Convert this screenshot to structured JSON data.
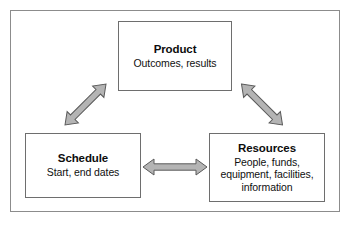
{
  "diagram": {
    "frame": {
      "name": "outer-frame"
    },
    "nodes": [
      {
        "id": "product",
        "title": "Product",
        "description_lines": [
          "Outcomes, results"
        ]
      },
      {
        "id": "schedule",
        "title": "Schedule",
        "description_lines": [
          "Start, end dates"
        ]
      },
      {
        "id": "resources",
        "title": "Resources",
        "description_lines": [
          "People, funds,",
          "equipment, facilities,",
          "information"
        ]
      }
    ],
    "connectors": [
      {
        "id": "schedule-product",
        "from": "Schedule",
        "to": "Product",
        "style": "double-headed-arrow",
        "direction": "diagonal-up-right"
      },
      {
        "id": "product-resources",
        "from": "Product",
        "to": "Resources",
        "style": "double-headed-arrow",
        "direction": "diagonal-down-right"
      },
      {
        "id": "schedule-resources",
        "from": "Schedule",
        "to": "Resources",
        "style": "double-headed-arrow",
        "direction": "horizontal"
      }
    ],
    "colors": {
      "arrow_fill": "#b4b4b4",
      "arrow_outline": "#5a5a5a",
      "box_border": "#6e6e6e",
      "frame_border": "#8c8c8c",
      "text": "#0d0d0d",
      "background": "#ffffff"
    }
  }
}
